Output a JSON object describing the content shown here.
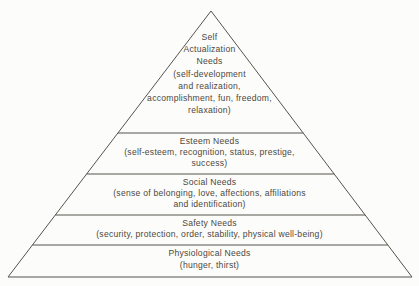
{
  "pyramid": {
    "title": "Hierarchy of needs pyramid",
    "colors": {
      "outline": "#57534b",
      "text": "#4c4841",
      "background": "#fcfcfa"
    },
    "levels": [
      {
        "name": "self-actualization-needs",
        "lines": {
          "l1": "Self",
          "l2": "Actualization",
          "l3": "Needs",
          "l4": "(self-development",
          "l5": "and realization,",
          "l6": "accomplishment, fun, freedom,",
          "l7": "relaxation)"
        }
      },
      {
        "name": "esteem-needs",
        "lines": {
          "l1": "Esteem Needs",
          "l2": "(self-esteem, recognition, status, prestige,",
          "l3": "success)"
        }
      },
      {
        "name": "social-needs",
        "lines": {
          "l1": "Social Needs",
          "l2": "(sense of belonging, love, affections, affiliations",
          "l3": "and identification)"
        }
      },
      {
        "name": "safety-needs",
        "lines": {
          "l1": "Safety Needs",
          "l2": "(security, protection, order, stability, physical well-being)"
        }
      },
      {
        "name": "physiological-needs",
        "lines": {
          "l1": "Physiological Needs",
          "l2": "(hunger, thirst)"
        }
      }
    ]
  }
}
